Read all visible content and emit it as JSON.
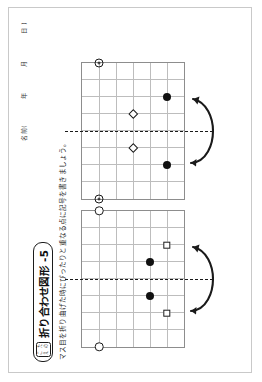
{
  "page": {
    "orientation": "landscape-rotated-90",
    "background": "#ffffff",
    "border_color": "#c9c9c9"
  },
  "header": {
    "name_label": "名前(",
    "year_label": "年",
    "month_label": "月",
    "day_label": "日",
    "close_paren": ")"
  },
  "title": {
    "badge_line1": "こた",
    "badge_line2": "えの",
    "badge_chars": [
      "こ",
      "た",
      "え",
      "の"
    ],
    "text": "折り合わせ図形 -5"
  },
  "instruction": {
    "text": "マス目を折り曲げた時にぴったりと重なる点に記号を書きましょう。"
  },
  "colors": {
    "ink": "#1a1a1a",
    "grid_line": "#bdbdbd",
    "grid_border": "#8d8d8d",
    "fill_dot": "#111111"
  },
  "grid_spec": {
    "cols": 8,
    "rows": 6,
    "cell_px": 17,
    "fold_axis": "vertical",
    "fold_col": 4
  },
  "problems": [
    {
      "id": "problem-1",
      "number": 1,
      "symbols": [
        {
          "name": "open-circle-left",
          "glyph": "○",
          "type": "circle",
          "col": 0,
          "row": 1
        },
        {
          "name": "open-circle-right",
          "glyph": "○",
          "type": "circle",
          "col": 8,
          "row": 1
        },
        {
          "name": "filled-dot-left",
          "glyph": "●",
          "type": "dot",
          "col": 3,
          "row": 4
        },
        {
          "name": "filled-dot-right",
          "glyph": "●",
          "type": "dot",
          "col": 5,
          "row": 4
        },
        {
          "name": "open-square-left",
          "glyph": "□",
          "type": "square",
          "col": 2,
          "row": 5
        },
        {
          "name": "open-square-right",
          "glyph": "□",
          "type": "square",
          "col": 6,
          "row": 5
        }
      ],
      "fold_arrow": "fold-arrow-curve"
    },
    {
      "id": "problem-2",
      "number": 2,
      "symbols": [
        {
          "name": "double-circle-left",
          "glyph": "◎",
          "type": "double-circle",
          "col": 0,
          "row": 1
        },
        {
          "name": "double-circle-right",
          "glyph": "◎",
          "type": "double-circle",
          "col": 8,
          "row": 1
        },
        {
          "name": "diamond-left",
          "glyph": "◇",
          "type": "diamond",
          "col": 3,
          "row": 3
        },
        {
          "name": "diamond-right",
          "glyph": "◇",
          "type": "diamond",
          "col": 5,
          "row": 3
        },
        {
          "name": "filled-dot-left",
          "glyph": "●",
          "type": "dot",
          "col": 2,
          "row": 5
        },
        {
          "name": "filled-dot-right",
          "glyph": "●",
          "type": "dot",
          "col": 6,
          "row": 5
        }
      ],
      "fold_arrow": "fold-arrow-curve"
    }
  ]
}
